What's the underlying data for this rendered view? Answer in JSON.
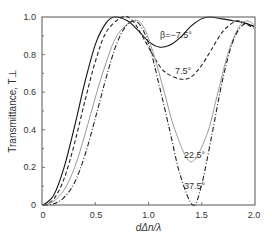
{
  "chart_data": {
    "type": "line",
    "title": "",
    "xlabel": "dΔn/λ",
    "ylabel": "Transmittance, T⊥",
    "xlim": [
      0,
      2.0
    ],
    "ylim": [
      0,
      1.0
    ],
    "xticks": [
      "0",
      "0.5",
      "1.0",
      "1.5",
      "2.0"
    ],
    "yticks": [
      "0",
      "0.2",
      "0.4",
      "0.6",
      "0.8",
      "1.0"
    ],
    "grid": false,
    "legend": "inline annotations",
    "series": [
      {
        "name": "β=−7.5°",
        "style": "solid",
        "color": "#111111",
        "x": [
          0,
          0.1,
          0.2,
          0.3,
          0.4,
          0.5,
          0.6,
          0.68,
          0.8,
          0.9,
          1.0,
          1.1,
          1.2,
          1.3,
          1.4,
          1.5,
          1.58,
          1.7,
          1.8,
          1.9,
          2.0
        ],
        "y": [
          0,
          0.05,
          0.2,
          0.42,
          0.66,
          0.86,
          0.97,
          1.0,
          0.98,
          0.93,
          0.87,
          0.84,
          0.85,
          0.89,
          0.95,
          0.99,
          1.0,
          0.99,
          0.98,
          0.97,
          0.95
        ]
      },
      {
        "name": "7.5°",
        "style": "dashed",
        "color": "#222222",
        "x": [
          0,
          0.1,
          0.2,
          0.3,
          0.4,
          0.5,
          0.6,
          0.75,
          0.85,
          0.95,
          1.05,
          1.15,
          1.3,
          1.4,
          1.5,
          1.6,
          1.7,
          1.8,
          1.85,
          1.9,
          2.0
        ],
        "y": [
          0,
          0.03,
          0.14,
          0.33,
          0.56,
          0.77,
          0.92,
          1.0,
          0.98,
          0.89,
          0.79,
          0.71,
          0.67,
          0.68,
          0.74,
          0.83,
          0.92,
          0.97,
          0.98,
          0.97,
          0.94
        ]
      },
      {
        "name": "22.5°",
        "style": "solid",
        "color": "#999999",
        "x": [
          0,
          0.1,
          0.2,
          0.3,
          0.4,
          0.5,
          0.6,
          0.7,
          0.85,
          0.95,
          1.05,
          1.15,
          1.25,
          1.4,
          1.55,
          1.65,
          1.75,
          1.85,
          1.93,
          2.0
        ],
        "y": [
          0,
          0.02,
          0.08,
          0.2,
          0.38,
          0.58,
          0.76,
          0.9,
          0.98,
          0.95,
          0.8,
          0.6,
          0.4,
          0.23,
          0.37,
          0.58,
          0.8,
          0.94,
          0.98,
          0.96
        ]
      },
      {
        "name": "37.5°",
        "style": "dashdot",
        "color": "#222222",
        "x": [
          0,
          0.1,
          0.2,
          0.3,
          0.4,
          0.5,
          0.6,
          0.7,
          0.8,
          0.9,
          1.0,
          1.1,
          1.2,
          1.3,
          1.42,
          1.5,
          1.6,
          1.7,
          1.8,
          1.9,
          2.0
        ],
        "y": [
          0,
          0.005,
          0.04,
          0.12,
          0.27,
          0.47,
          0.68,
          0.86,
          0.96,
          0.97,
          0.86,
          0.64,
          0.4,
          0.16,
          0.0,
          0.1,
          0.37,
          0.66,
          0.87,
          0.96,
          0.95
        ]
      }
    ],
    "annotations": [
      {
        "text": "β=−7.5°",
        "x": 1.18,
        "y": 0.9
      },
      {
        "text": "7.5°",
        "x": 1.25,
        "y": 0.72
      },
      {
        "text": "22.5°",
        "x": 1.35,
        "y": 0.3
      },
      {
        "text": "37.5°",
        "x": 1.35,
        "y": 0.08
      }
    ]
  },
  "labels": {
    "xlabel": "dΔn/λ",
    "ylabel": "Transmittance, T⊥",
    "xticks": [
      "0",
      "0.5",
      "1.0",
      "1.5",
      "2.0"
    ],
    "yticks": [
      "0",
      "0.2",
      "0.4",
      "0.6",
      "0.8",
      "1.0"
    ],
    "curve_labels": [
      "β=−7.5°",
      "7.5°",
      "22.5°",
      "37.5°"
    ]
  }
}
